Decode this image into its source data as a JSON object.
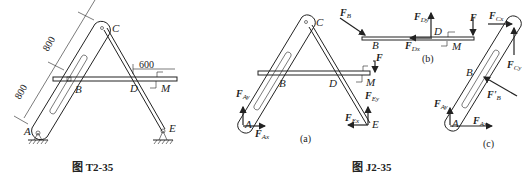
{
  "figure_left": {
    "caption": "图 T2-35",
    "points": {
      "A": "A",
      "B": "B",
      "C": "C",
      "D": "D",
      "E": "E"
    },
    "dimensions": {
      "upper": "800",
      "lower": "800",
      "horizontal": "600"
    },
    "moment": "M"
  },
  "figure_right": {
    "caption": "图 J2-35",
    "panels": {
      "a": {
        "label": "(a)",
        "points": {
          "A": "A",
          "B": "B",
          "C": "C",
          "D": "D",
          "E": "E"
        },
        "forces": {
          "F_Ay": "F",
          "F_Ay_sub": "Ay",
          "F_Ax": "F",
          "F_Ax_sub": "Ax",
          "F_Ey": "F",
          "F_Ey_sub": "Ey",
          "F_Ex": "F",
          "F_Ex_sub": "Ex",
          "F": "F"
        },
        "moment": "M"
      },
      "b": {
        "label": "(b)",
        "points": {
          "B": "B",
          "D": "D"
        },
        "forces": {
          "F_B": "F",
          "F_B_sub": "B",
          "F_Dy": "F",
          "F_Dy_sub": "Dy",
          "F_Dx": "F",
          "F_Dx_sub": "Dx",
          "F": "F"
        },
        "moment": "M"
      },
      "c": {
        "label": "(c)",
        "points": {
          "A": "A",
          "B": "B"
        },
        "forces": {
          "F_Cx": "F",
          "F_Cx_sub": "Cx",
          "F_Cy": "F",
          "F_Cy_sub": "Cy",
          "F_B_prime": "F'",
          "F_B_prime_sub": "B",
          "F_Ay": "F",
          "F_Ay_sub": "Ay",
          "F_Ax": "F",
          "F_Ax_sub": "Ax"
        }
      }
    }
  }
}
